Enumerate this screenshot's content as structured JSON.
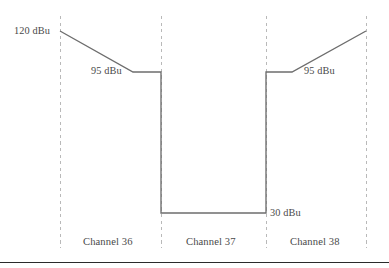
{
  "figure": {
    "kind": "spectrum-mask-diagram",
    "background_color": "#ffffff",
    "trace_color": "#6d6d6d",
    "guide_color": "#b9b9b9",
    "text_color": "#4a4a4a",
    "rule_color": "#2b2b2b"
  },
  "labels": {
    "level_high_left": "120 dBu",
    "level_mid_left": "95 dBu",
    "level_low": "30 dBu",
    "level_mid_right": "95 dBu",
    "channel_left": "Channel 36",
    "channel_center": "Channel 37",
    "channel_right": "Channel 38"
  },
  "chart_data": {
    "type": "line",
    "title": "",
    "xlabel": "",
    "ylabel": "",
    "grid": false,
    "legend": "none",
    "x_categories": [
      "Channel 36",
      "Channel 37",
      "Channel 38"
    ],
    "y_unit": "dBu",
    "y_levels": [
      120,
      95,
      30
    ],
    "channel_boundaries_px": [
      60,
      161,
      266,
      366
    ],
    "series": [
      {
        "name": "Spectrum mask",
        "points": [
          {
            "x_px": 60,
            "y_px": 31,
            "level": 120
          },
          {
            "x_px": 133,
            "y_px": 72,
            "level": 95
          },
          {
            "x_px": 161,
            "y_px": 72,
            "level": 95
          },
          {
            "x_px": 161,
            "y_px": 213,
            "level": 30
          },
          {
            "x_px": 266,
            "y_px": 213,
            "level": 30
          },
          {
            "x_px": 266,
            "y_px": 72,
            "level": 95
          },
          {
            "x_px": 292,
            "y_px": 72,
            "level": 95
          },
          {
            "x_px": 366,
            "y_px": 31,
            "level": 120
          }
        ]
      }
    ],
    "annotations": [
      {
        "text": "120 dBu",
        "x_px": 14,
        "y_px": 25
      },
      {
        "text": "95 dBu",
        "x_px": 91,
        "y_px": 65
      },
      {
        "text": "30 dBu",
        "x_px": 270,
        "y_px": 207
      },
      {
        "text": "95 dBu",
        "x_px": 304,
        "y_px": 65
      },
      {
        "text": "Channel 36",
        "x_px": 83,
        "y_px": 236
      },
      {
        "text": "Channel 37",
        "x_px": 186,
        "y_px": 236
      },
      {
        "text": "Channel 38",
        "x_px": 290,
        "y_px": 236
      }
    ]
  }
}
